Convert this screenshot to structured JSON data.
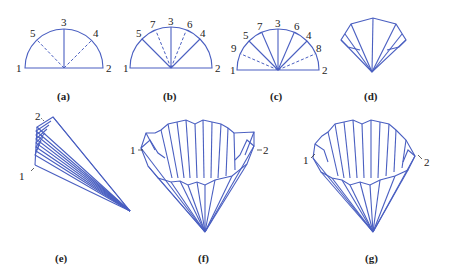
{
  "figure": {
    "line_color": "#4a5fc1",
    "panels": [
      {
        "id": "a",
        "caption": "(a)",
        "labels": [
          "1",
          "2",
          "3",
          "4",
          "5"
        ],
        "description": "Semicircle with vertical crease 3 and dashed creases 4 and 5"
      },
      {
        "id": "b",
        "caption": "(b)",
        "labels": [
          "1",
          "2",
          "3",
          "4",
          "5",
          "6",
          "7"
        ],
        "description": "Semicircle with solid creases 3,4,5 and dashed creases 6,7"
      },
      {
        "id": "c",
        "caption": "(c)",
        "labels": [
          "1",
          "2",
          "3",
          "4",
          "5",
          "6",
          "7",
          "8",
          "9"
        ],
        "description": "Semicircle with solid creases 3-7 and dashed creases 8,9"
      },
      {
        "id": "d",
        "caption": "(d)",
        "labels": [],
        "description": "Partially folded fan"
      },
      {
        "id": "e",
        "caption": "(e)",
        "labels": [
          "1",
          "2"
        ],
        "description": "Fully pleated stack viewed from side"
      },
      {
        "id": "f",
        "caption": "(f)",
        "labels": [
          "1",
          "2"
        ],
        "description": "Opened pleated cone, front view"
      },
      {
        "id": "g",
        "caption": "(g)",
        "labels": [
          "1",
          "2"
        ],
        "description": "Opened pleated cone, alternative view"
      }
    ]
  }
}
